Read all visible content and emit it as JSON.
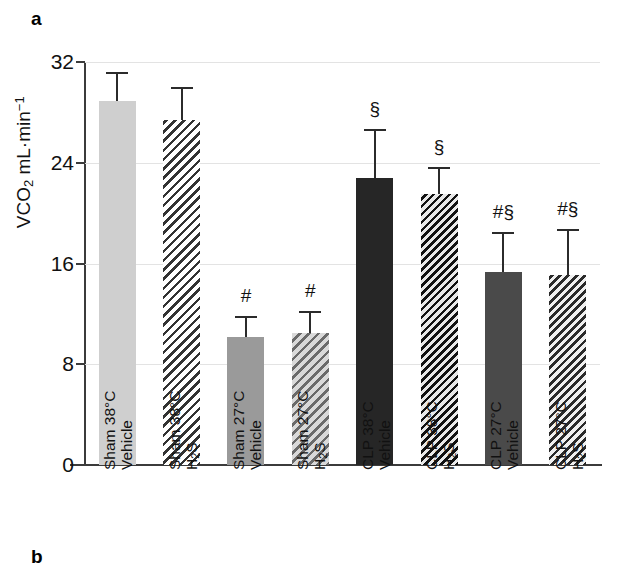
{
  "figure": {
    "panel_a_letter": "a",
    "panel_b_letter": "b"
  },
  "chart_data": {
    "type": "bar",
    "title": "",
    "xlabel": "",
    "ylabel": "VCO2 mL·min⁻¹",
    "ylabel_parts": {
      "prefix": "VCO",
      "sub": "2",
      "middle": " mL·min",
      "sup": "−1"
    },
    "ylim": [
      0,
      32
    ],
    "yticks": [
      0,
      8,
      16,
      24,
      32
    ],
    "ytick_labels": [
      "0",
      "8",
      "16",
      "24",
      "32"
    ],
    "grid": true,
    "grid_axis": "y",
    "legend": "none",
    "categories": [
      "Sham 38°C Vehicle",
      "Sham 38°C H2S",
      "Sham 27°C Vehicle",
      "Sham 27°C H2S",
      "CLP 38°C Vehicle",
      "CLP 38°C H2S",
      "CLP 27°C Vehicle",
      "CLP 27°C H2S"
    ],
    "values": [
      28.9,
      27.4,
      10.2,
      10.5,
      22.8,
      21.5,
      15.3,
      15.1
    ],
    "errors": [
      2.3,
      2.6,
      1.6,
      1.7,
      3.9,
      2.2,
      3.2,
      3.6
    ],
    "annotations": [
      "",
      "",
      "#",
      "#",
      "§",
      "§",
      "#§",
      "#§"
    ],
    "bar_styles": [
      "solid-light",
      "hatch-light",
      "solid-medium",
      "hatch-medium",
      "solid-black",
      "hatch-black",
      "solid-dark",
      "hatch-dark"
    ],
    "colors": {
      "solid_light": "#cfcfcf",
      "solid_medium": "#9a9a9a",
      "solid_dark": "#4a4a4a",
      "solid_black": "#262626",
      "axis": "#3b3b3b",
      "grid": "#e3e3e3",
      "error_bar": "#2b2b2b"
    }
  },
  "xticks": [
    {
      "line1": "Sham 38°C",
      "line2_pre": "Vehicle",
      "line2_sub": "",
      "line2_post": ""
    },
    {
      "line1": "Sham 38°C",
      "line2_pre": "H",
      "line2_sub": "2",
      "line2_post": "S"
    },
    {
      "line1": "Sham 27°C",
      "line2_pre": "Vehicle",
      "line2_sub": "",
      "line2_post": ""
    },
    {
      "line1": "Sham 27°C",
      "line2_pre": "H",
      "line2_sub": "2",
      "line2_post": "S"
    },
    {
      "line1": "CLP 38°C",
      "line2_pre": "Vehicle",
      "line2_sub": "",
      "line2_post": ""
    },
    {
      "line1": "CLP 38°C",
      "line2_pre": "H",
      "line2_sub": "2",
      "line2_post": "S"
    },
    {
      "line1": "CLP 27°C",
      "line2_pre": "Vehicle",
      "line2_sub": "",
      "line2_post": ""
    },
    {
      "line1": "CLP 27°C",
      "line2_pre": "H",
      "line2_sub": "2",
      "line2_post": "S"
    }
  ]
}
